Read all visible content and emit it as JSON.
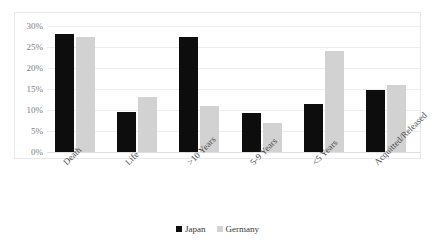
{
  "chart_data": {
    "type": "bar",
    "title": "",
    "subtitle": "",
    "xlabel": "",
    "ylabel": "",
    "categories": [
      "Death",
      "Life",
      ">10 Years",
      "5-9 Years",
      "<5 Years",
      "Acquitted/Released"
    ],
    "series": [
      {
        "name": "Japan",
        "color": "#0d0d0d",
        "values": [
          28.2,
          9.5,
          27.3,
          9.3,
          11.5,
          14.8
        ]
      },
      {
        "name": "Germany",
        "color": "#d2d2d2",
        "values": [
          27.3,
          13.0,
          11.0,
          7.0,
          24.0,
          16.0
        ]
      }
    ],
    "ylim": [
      0,
      30
    ],
    "yticks": [
      0,
      5,
      10,
      15,
      20,
      25,
      30
    ],
    "ytick_labels": [
      "0%",
      "5%",
      "10%",
      "15%",
      "20%",
      "25%",
      "30%"
    ],
    "grid": true,
    "grid_axis": "y",
    "legend_position": "bottom",
    "xtick_rotation": -45,
    "plot_border": true
  },
  "axes": {
    "y_ticks": [
      "0%",
      "5%",
      "10%",
      "15%",
      "20%",
      "25%",
      "30%"
    ],
    "x_categories": [
      "Death",
      "Life",
      ">10 Years",
      "5-9 Years",
      "<5 Years",
      "Acquitted/Released"
    ]
  },
  "legend": {
    "items": [
      {
        "label": "Japan",
        "color": "#0d0d0d"
      },
      {
        "label": "Germany",
        "color": "#d2d2d2"
      }
    ]
  },
  "top_cut_text": ""
}
